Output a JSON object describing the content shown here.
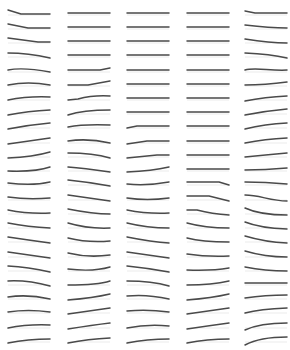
{
  "grid": {
    "columns_x": [
      8,
      68,
      127,
      187,
      245
    ],
    "rows_y": [
      13,
      27,
      41,
      55,
      70,
      84,
      98,
      112,
      126,
      141,
      155,
      169,
      183,
      198,
      212,
      226,
      240,
      255,
      269,
      283,
      297,
      311,
      326,
      340
    ],
    "cell_width": 42,
    "stroke_color": "#4a4a4a",
    "shadow_color": "#ececec"
  },
  "columns": [
    {
      "name": "column-1",
      "paths": [
        "M0,-3 L13,1 L42,1",
        "M0,-3 L20,1 L42,1",
        "M0,-3 L30,1 L42,1",
        "M0,-2 Q20,-2 42,3",
        "M0,0 Q15,-3 42,2",
        "M0,1 Q20,-3 42,1",
        "M0,2 Q20,-2 42,-1",
        "M0,3 Q20,-1 42,-2",
        "M0,3 Q20,-1 42,-3",
        "M0,3 Q21,0 42,-3",
        "M0,3 Q25,2 42,-3",
        "M0,2 Q28,3 42,-2",
        "M0,0 Q25,3 42,-1",
        "M0,-1 Q20,2 42,0",
        "M0,-2 Q20,2 42,1",
        "M0,-3 Q20,1 42,2",
        "M0,-3 Q20,0 42,3",
        "M0,-3 L42,3",
        "M0,-3 Q20,-2 42,3",
        "M0,-2 Q20,-3 42,3",
        "M0,0 Q20,-3 42,2",
        "M0,1 Q20,-2 42,1",
        "M0,2 Q20,-2 42,-1",
        "M0,3 Q20,-1 42,-1"
      ]
    },
    {
      "name": "column-2",
      "paths": [
        "M0,0 L42,0",
        "M0,0 L42,0",
        "M0,0 L42,0",
        "M0,0 L42,0",
        "M0,0 L32,0 L42,-2",
        "M0,1 L20,1 L42,-3",
        "M0,2 L10,1 Q25,-3 42,-2",
        "M0,3 Q15,-2 42,-2",
        "M0,1 Q15,-2 42,-1",
        "M0,0 Q20,-3 42,2",
        "M0,-2 Q25,-2 42,3",
        "M0,-2 Q15,-1 42,3",
        "M0,-3 Q20,-1 42,3",
        "M0,-3 L42,3",
        "M0,-3 Q25,2 42,2",
        "M0,-3 Q20,3 42,2",
        "M0,-2 Q20,3 42,1",
        "M0,-2 Q20,3 42,0",
        "M0,0 Q25,3 42,-2",
        "M0,2 Q30,2 42,-2",
        "M0,3 Q25,1 42,-3",
        "M0,3 L42,-3",
        "M0,3 Q25,-1 42,-3",
        "M0,3 Q20,-1 42,-2"
      ]
    },
    {
      "name": "column-3",
      "paths": [
        "M0,0 L42,0",
        "M0,0 L42,0",
        "M0,0 L42,0",
        "M0,0 L42,0",
        "M0,0 L42,0",
        "M0,0 L42,0",
        "M0,0 L42,0",
        "M0,0 L42,0",
        "M0,2 L10,0 L42,0",
        "M0,3 L20,0 L42,0",
        "M0,3 L30,0 L42,0",
        "M0,3 Q25,2 42,-2",
        "M0,1 Q20,3 42,-1",
        "M0,0 Q20,3 42,0",
        "M0,-2 Q20,2 42,1",
        "M0,-3 Q20,2 42,2",
        "M0,-3 Q25,2 42,3",
        "M0,-3 L42,3",
        "M0,-3 Q20,-1 42,3",
        "M0,-2 Q25,-2 42,3",
        "M0,-1 Q20,-3 42,2",
        "M0,0 Q20,-2 42,1",
        "M0,2 Q20,-2 42,0",
        "M0,3 Q20,-1 42,-1"
      ]
    },
    {
      "name": "column-4",
      "paths": [
        "M0,0 L42,0",
        "M0,0 L42,0",
        "M0,0 L42,0",
        "M0,0 L42,0",
        "M0,0 L42,0",
        "M0,0 L42,0",
        "M0,0 L42,0",
        "M0,0 L42,0",
        "M0,0 L42,0",
        "M0,0 L42,0",
        "M0,0 L42,0",
        "M0,0 L42,0",
        "M0,-1 L32,-1 L42,2",
        "M0,-2 L22,-2 L42,3",
        "M0,-2 L10,-2 Q25,2 42,3",
        "M0,-3 Q18,2 42,2",
        "M0,-2 Q15,2 42,2",
        "M0,-1 Q20,2 42,1",
        "M0,1 Q25,2 42,-1",
        "M0,2 Q25,2 42,-2",
        "M0,3 Q25,1 42,-3",
        "M0,3 L42,-3",
        "M0,3 Q20,0 42,-3",
        "M0,3 Q20,-1 42,-1"
      ]
    },
    {
      "name": "column-5",
      "paths": [
        "M0,-2 L10,0 L42,0",
        "M0,-2 Q25,1 42,1",
        "M0,-2 Q25,2 42,2",
        "M0,-2 Q25,-1 42,3",
        "M0,0 C10,-3 25,1 42,0",
        "M0,1 Q20,1 42,-2",
        "M0,3 Q20,-1 42,-2",
        "M0,3 Q20,-1 42,-3",
        "M0,3 Q20,-2 42,-3",
        "M0,2 Q20,-2 42,-3",
        "M0,2 Q20,0 42,-2",
        "M0,1 Q20,1 42,-1",
        "M0,-1 Q20,-1 42,1",
        "M0,-3 C15,-3 25,3 42,3",
        "M0,-4 Q15,3 42,3",
        "M0,-4 Q15,2 42,3",
        "M0,-4 Q20,2 42,3",
        "M0,-4 Q20,2 42,2",
        "M0,-2 Q20,2 42,2",
        "M0,0 L42,0",
        "M0,1 Q20,-2 42,-2",
        "M0,2 Q15,-2 42,-3",
        "M0,4 Q15,-3 42,-3",
        "M0,5 Q15,-3 42,-3"
      ]
    }
  ]
}
